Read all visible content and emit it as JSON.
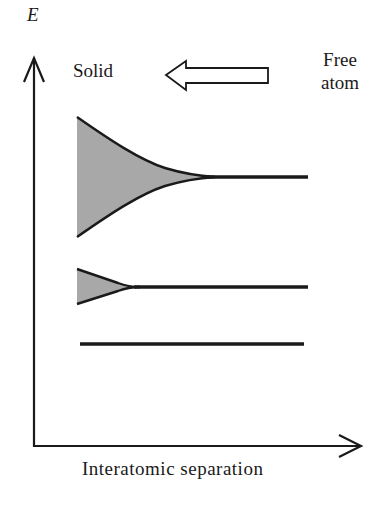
{
  "figure": {
    "y_axis_label": "E",
    "x_axis_label": "Interatomic separation",
    "left_label": "Solid",
    "right_label_line1": "Free",
    "right_label_line2": "atom",
    "arrow_direction": "left"
  },
  "colors": {
    "line": "#1a1a1a",
    "band_fill": "#a8a8a8",
    "background": "#ffffff"
  },
  "levels": [
    {
      "name": "upper-level",
      "band_broadened": true,
      "band_width_at_solid": "wide"
    },
    {
      "name": "middle-level",
      "band_broadened": true,
      "band_width_at_solid": "narrow"
    },
    {
      "name": "lower-level",
      "band_broadened": false
    }
  ]
}
